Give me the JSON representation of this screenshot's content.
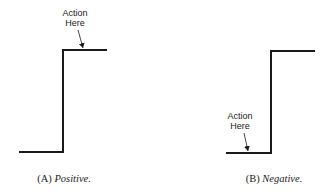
{
  "figure": {
    "panels": [
      {
        "id": "A",
        "caption_prefix": "(A)",
        "caption_title": "Positive.",
        "annotation_line1": "Action",
        "annotation_line2": "Here",
        "annotation_target": "top of rising edge"
      },
      {
        "id": "B",
        "caption_prefix": "(B)",
        "caption_title": "Negative.",
        "annotation_line1": "Action",
        "annotation_line2": "Here",
        "annotation_target": "bottom of step (before rising edge)"
      }
    ],
    "colors": {
      "line": "#1a1a1a",
      "background": "#ffffff"
    }
  }
}
